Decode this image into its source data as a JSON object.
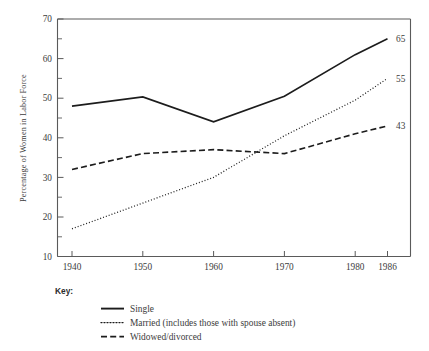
{
  "chart_data": {
    "type": "line",
    "title": "",
    "xlabel": "",
    "ylabel": "Percentage of Women in Labor Force",
    "x": [
      1940,
      1950,
      1960,
      1970,
      1980,
      1986
    ],
    "categories": [
      "1940",
      "1950",
      "1960",
      "1970",
      "1980",
      "1986"
    ],
    "xlim": [
      1937,
      1988
    ],
    "ylim": [
      10,
      70
    ],
    "ytick_labels": [
      "10",
      "20",
      "30",
      "40",
      "50",
      "60",
      "70"
    ],
    "ytick_values": [
      10,
      20,
      30,
      40,
      50,
      60,
      70
    ],
    "yminor_values": [
      15,
      25,
      35,
      45,
      55,
      65
    ],
    "grid": false,
    "legend_position": "below-plot",
    "series": [
      {
        "name": "Single",
        "style": "solid",
        "values": [
          48,
          50.3,
          44,
          50.5,
          61,
          65
        ],
        "end_label": "65"
      },
      {
        "name": "Married (includes those with spouse absent)",
        "style": "dotted",
        "values": [
          17,
          23.5,
          30,
          40.5,
          49.5,
          55
        ],
        "end_label": "55"
      },
      {
        "name": "Widowed/divorced",
        "style": "dashed",
        "values": [
          32,
          36,
          37,
          36,
          41,
          43
        ],
        "end_label": "43"
      }
    ],
    "end_labels": [
      "65",
      "55",
      "43"
    ],
    "annotations": []
  },
  "key": {
    "title": "Key:",
    "items": [
      {
        "label": "Single",
        "style": "solid"
      },
      {
        "label": "Married (includes those with spouse absent)",
        "style": "dotted"
      },
      {
        "label": "Widowed/divorced",
        "style": "dashed"
      }
    ]
  },
  "colors": {
    "line": "#1c1c1c",
    "frame": "#5a5a5a",
    "text": "#3c3c3c",
    "background": "#ffffff"
  }
}
